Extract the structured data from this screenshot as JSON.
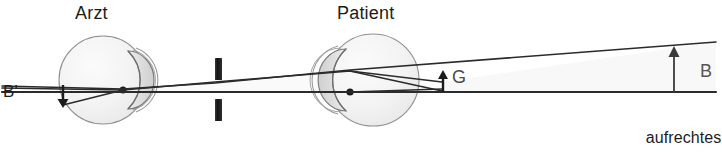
{
  "figure": {
    "type": "optics-ray-diagram",
    "topic": "direkte Ophthalmoskopie",
    "width": 722,
    "height": 162,
    "background_color": "#ffffff"
  },
  "labels": {
    "doctor": "Arzt",
    "patient": "Patient",
    "image_point": "B'",
    "object_point": "G",
    "image_size": "B",
    "caption_line1": "aufrechtes",
    "caption_line2": "Bild"
  },
  "colors": {
    "ink": "#1c1c1c",
    "ray": "#2b2b2b",
    "eye_outline": "#8d8d8d",
    "eye_fill": "#f4f4f4",
    "lens_fill": "#e2e2e2",
    "aperture_bar": "#1a1a1a",
    "gray_label": "#4a4a4a",
    "wedge_fill": "#f7f7f7"
  },
  "elements": {
    "doctor_eye": {
      "name": "Arzt",
      "center_x": 103,
      "center_y": 80,
      "radius": 44,
      "lens_side": "right",
      "nodal_point_x": 123,
      "nodal_point_y": 90
    },
    "patient_eye": {
      "name": "Patient",
      "center_x": 373,
      "center_y": 80,
      "radius": 46,
      "lens_side": "left",
      "nodal_point_x": 350,
      "nodal_point_y": 92
    },
    "aperture": {
      "name": "slit-aperture",
      "x": 215,
      "bar_width": 7,
      "upper_bar": {
        "y": 58,
        "height": 22
      },
      "lower_bar": {
        "y": 99,
        "height": 22
      }
    },
    "optical_axis": {
      "y": 92,
      "x_start": 2,
      "x_end": 716
    },
    "object_arrow_G": {
      "x": 442,
      "y_base": 92,
      "y_tip": 74
    },
    "image_arrow_Bprime": {
      "x": 63,
      "y_base": 86,
      "y_tip": 104
    },
    "image_arrow_B": {
      "x": 674,
      "y_base": 96,
      "y_tip": 50
    }
  },
  "rays": [
    {
      "name": "chief-ray-lower",
      "points": "2,88 123,90 350,92 442,92 716,92"
    },
    {
      "name": "ray-upper-sloped",
      "points": "63,105 123,90 215,82 350,72 442,82 560,66 716,44"
    },
    {
      "name": "ray-through-nodal",
      "points": "350,72 442,92"
    },
    {
      "name": "ray-fan-top",
      "points": "2,86 350,70 716,42"
    }
  ]
}
